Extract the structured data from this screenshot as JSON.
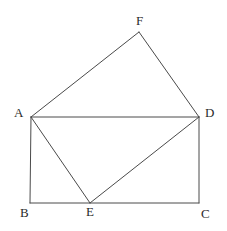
{
  "figure": {
    "background_color": "#ffffff",
    "stroke_color": "#4a4a4a",
    "stroke_width": 1,
    "label_color": "#2b2b2b",
    "width": 227,
    "height": 231,
    "vertices": [
      {
        "id": "A",
        "label": "A",
        "x": 31,
        "y": 117,
        "label_x": 14,
        "label_y": 106
      },
      {
        "id": "B",
        "label": "B",
        "x": 30,
        "y": 203,
        "label_x": 20,
        "label_y": 206
      },
      {
        "id": "C",
        "label": "C",
        "x": 199,
        "y": 203,
        "label_x": 201,
        "label_y": 207
      },
      {
        "id": "D",
        "label": "D",
        "x": 199,
        "y": 117,
        "label_x": 205,
        "label_y": 106
      },
      {
        "id": "E",
        "label": "E",
        "x": 90,
        "y": 203,
        "label_x": 86,
        "label_y": 205
      },
      {
        "id": "F",
        "label": "F",
        "x": 139,
        "y": 32,
        "label_x": 136,
        "label_y": 14
      }
    ],
    "segments": [
      {
        "name": "side-AB",
        "from": "A",
        "to": "B"
      },
      {
        "name": "side-BC",
        "from": "B",
        "to": "C"
      },
      {
        "name": "side-CD",
        "from": "C",
        "to": "D"
      },
      {
        "name": "side-DA",
        "from": "D",
        "to": "A"
      },
      {
        "name": "side-AF",
        "from": "A",
        "to": "F"
      },
      {
        "name": "side-FD",
        "from": "F",
        "to": "D"
      },
      {
        "name": "side-AE",
        "from": "A",
        "to": "E"
      },
      {
        "name": "side-ED",
        "from": "E",
        "to": "D"
      }
    ]
  }
}
